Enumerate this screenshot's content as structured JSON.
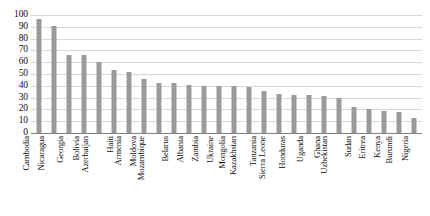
{
  "chart_data": {
    "type": "bar",
    "title": "",
    "xlabel": "",
    "ylabel": "",
    "ylim": [
      0,
      100
    ],
    "yticks": [
      0,
      10,
      20,
      30,
      40,
      50,
      60,
      70,
      80,
      90,
      100
    ],
    "grid": true,
    "legend": "none",
    "bar_color": "#9b9b9b",
    "gridline_color": "#d9d9d9",
    "axis_color": "#808080",
    "categories": [
      "Cambodia",
      "Nicaragua",
      "Georgia",
      "Bolivia",
      "Azerbaijan",
      "Haiti",
      "Armenia",
      "Moldova",
      "Mozambique",
      "Belarus",
      "Albania",
      "Zambia",
      "Ukraine",
      "Mongolia",
      "Kazakhstan",
      "Tanzania",
      "Sierra Leone",
      "Honduras",
      "Uganda",
      "Ghana",
      "Uzbekistan",
      "Sudan",
      "Eritrea",
      "Kenya",
      "Burundi",
      "Nigeria"
    ],
    "values": [
      97,
      91,
      66,
      66,
      60,
      53,
      52,
      46,
      42,
      42,
      41,
      40,
      40,
      40,
      39,
      36,
      33,
      32,
      32,
      31,
      30,
      22,
      20,
      19,
      18,
      13
    ]
  }
}
